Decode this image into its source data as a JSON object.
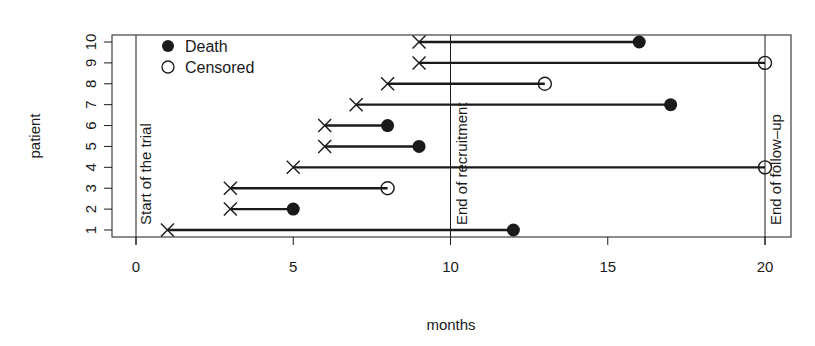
{
  "chart_data": {
    "type": "line",
    "subtype": "swimmer-plot",
    "title": "",
    "xlabel": "months",
    "ylabel": "patient",
    "xlim": [
      -0.8,
      20.8
    ],
    "ylim": [
      0.7,
      10.3
    ],
    "x_ticks": [
      0,
      5,
      10,
      15,
      20
    ],
    "y_ticks": [
      1,
      2,
      3,
      4,
      5,
      6,
      7,
      8,
      9,
      10
    ],
    "grid": false,
    "legend": {
      "position": "top-left",
      "entries": [
        {
          "label": "Death",
          "marker": "filled-circle"
        },
        {
          "label": "Censored",
          "marker": "open-circle"
        }
      ]
    },
    "reference_lines": [
      {
        "x": 0,
        "label": "Start of the trial"
      },
      {
        "x": 10,
        "label": "End of recruitment"
      },
      {
        "x": 20,
        "label": "End of follow–up"
      }
    ],
    "patients": [
      {
        "patient": 1,
        "entry": 1,
        "end": 12,
        "status": "Death"
      },
      {
        "patient": 2,
        "entry": 3,
        "end": 5,
        "status": "Death"
      },
      {
        "patient": 3,
        "entry": 3,
        "end": 8,
        "status": "Censored"
      },
      {
        "patient": 4,
        "entry": 5,
        "end": 20,
        "status": "Censored"
      },
      {
        "patient": 5,
        "entry": 6,
        "end": 9,
        "status": "Death"
      },
      {
        "patient": 6,
        "entry": 6,
        "end": 8,
        "status": "Death"
      },
      {
        "patient": 7,
        "entry": 7,
        "end": 17,
        "status": "Death"
      },
      {
        "patient": 8,
        "entry": 8,
        "end": 13,
        "status": "Censored"
      },
      {
        "patient": 9,
        "entry": 9,
        "end": 20,
        "status": "Censored"
      },
      {
        "patient": 10,
        "entry": 9,
        "end": 16,
        "status": "Death"
      }
    ],
    "entry_marker": "x"
  },
  "labels": {
    "xlabel": "months",
    "ylabel": "patient",
    "legend_death": "Death",
    "legend_censored": "Censored",
    "ref_start": "Start of the trial",
    "ref_recruit": "End of recruitment",
    "ref_followup": "End of follow–up"
  },
  "colors": {
    "ink": "#1a1a1a",
    "background": "#ffffff"
  }
}
